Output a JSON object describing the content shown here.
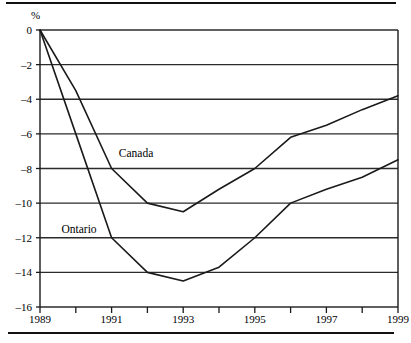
{
  "figure": {
    "unit_label": "%",
    "top_rule": true,
    "bottom_rule": true
  },
  "chart_data": {
    "type": "line",
    "title": "",
    "subtitle": "",
    "xlabel": "",
    "ylabel": "%",
    "x": [
      1989,
      1990,
      1991,
      1992,
      1993,
      1994,
      1995,
      1996,
      1997,
      1998,
      1999
    ],
    "xlim": [
      1989,
      1999
    ],
    "ylim": [
      -16,
      0
    ],
    "ytick_labels": [
      "0",
      "-2",
      "-4",
      "-6",
      "-8",
      "-10",
      "-12",
      "-14",
      "-16"
    ],
    "ytick_values": [
      0,
      -2,
      -4,
      -6,
      -8,
      -10,
      -12,
      -14,
      -16
    ],
    "xtick_values": [
      1989,
      1990,
      1991,
      1992,
      1993,
      1994,
      1995,
      1996,
      1997,
      1998,
      1999
    ],
    "xtick_labels": [
      "1989",
      "",
      "1991",
      "",
      "1993",
      "",
      "1995",
      "",
      "1997",
      "",
      "1999"
    ],
    "xtick_labels_shown": [
      "1989",
      "1991",
      "1993",
      "1995",
      "1997",
      "1999"
    ],
    "grid": "horizontal",
    "legend": "inline-annotations",
    "line_color": "#1a1a1a",
    "grid_color": "#2b2b2b",
    "series": [
      {
        "name": "Canada",
        "values": [
          0,
          -3.5,
          -8.0,
          -10.0,
          -10.5,
          -9.2,
          -8.0,
          -6.2,
          -5.5,
          -4.6,
          -3.8
        ]
      },
      {
        "name": "Ontario",
        "values": [
          0,
          -6.0,
          -12.0,
          -14.0,
          -14.5,
          -13.7,
          -12.0,
          -10.0,
          -9.2,
          -8.5,
          -7.5
        ]
      }
    ],
    "annotations": [
      {
        "text": "Canada",
        "x": 1991.2,
        "y": -7.1
      },
      {
        "text": "Ontario",
        "x": 1989.6,
        "y": -11.5
      }
    ]
  }
}
